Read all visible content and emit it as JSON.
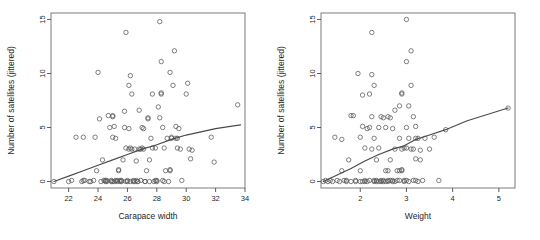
{
  "figure": {
    "type": "scatter-matrix",
    "panel_count": 2,
    "background": "#ffffff",
    "point_color": "#555555",
    "line_color": "#4a4a4a"
  },
  "panels": [
    {
      "id": "carapace-width",
      "xlabel": "Carapace width",
      "ylabel": "Number of satellites (jittered)",
      "xticks": [
        "22",
        "24",
        "26",
        "28",
        "30",
        "32",
        "34"
      ],
      "yticks": [
        "0",
        "5",
        "10",
        "15"
      ]
    },
    {
      "id": "weight",
      "xlabel": "Weight",
      "ylabel": "Number of satellites (jittered)",
      "xticks": [
        "2",
        "3",
        "4",
        "5"
      ],
      "yticks": [
        "0",
        "5",
        "10",
        "15"
      ]
    }
  ],
  "chart_data": [
    {
      "type": "scatter",
      "title": "",
      "xlabel": "Carapace width",
      "ylabel": "Number of satellites (jittered)",
      "xlim": [
        20.8,
        34.0
      ],
      "ylim": [
        -0.6,
        15.6
      ],
      "xticks": [
        22,
        24,
        26,
        28,
        30,
        32,
        34
      ],
      "yticks": [
        0,
        5,
        10,
        15
      ],
      "grid": false,
      "legend": "none",
      "marker": "open-circle",
      "points": [
        [
          21.0,
          0.0
        ],
        [
          22.0,
          0.0
        ],
        [
          22.5,
          4.1
        ],
        [
          22.9,
          0.0
        ],
        [
          23.1,
          0.1
        ],
        [
          23.0,
          4.1
        ],
        [
          23.8,
          4.1
        ],
        [
          23.7,
          0.1
        ],
        [
          23.9,
          1.0
        ],
        [
          24.0,
          10.1
        ],
        [
          24.1,
          5.8
        ],
        [
          24.2,
          0.0
        ],
        [
          24.3,
          2.0
        ],
        [
          24.5,
          0.0
        ],
        [
          24.5,
          0.1
        ],
        [
          24.6,
          0.0
        ],
        [
          24.7,
          6.1
        ],
        [
          24.8,
          5.0
        ],
        [
          24.9,
          0.0
        ],
        [
          24.9,
          0.1
        ],
        [
          25.0,
          6.0
        ],
        [
          25.0,
          6.1
        ],
        [
          25.0,
          4.1
        ],
        [
          25.1,
          5.1
        ],
        [
          25.1,
          0.0
        ],
        [
          25.2,
          0.1
        ],
        [
          25.2,
          4.0
        ],
        [
          25.3,
          0.0
        ],
        [
          25.4,
          1.1
        ],
        [
          25.4,
          1.0
        ],
        [
          25.5,
          0.0
        ],
        [
          25.6,
          0.1
        ],
        [
          25.7,
          2.0
        ],
        [
          25.8,
          5.0
        ],
        [
          25.8,
          6.5
        ],
        [
          25.9,
          13.8
        ],
        [
          25.9,
          0.0
        ],
        [
          25.9,
          3.1
        ],
        [
          26.0,
          0.0
        ],
        [
          26.0,
          0.1
        ],
        [
          26.1,
          8.9
        ],
        [
          26.1,
          4.9
        ],
        [
          26.1,
          3.0
        ],
        [
          26.2,
          9.8
        ],
        [
          26.2,
          3.1
        ],
        [
          26.2,
          0.0
        ],
        [
          26.3,
          8.1
        ],
        [
          26.3,
          3.0
        ],
        [
          26.4,
          0.1
        ],
        [
          26.5,
          0.0
        ],
        [
          26.5,
          3.0
        ],
        [
          26.6,
          1.9
        ],
        [
          26.7,
          0.0
        ],
        [
          26.8,
          6.6
        ],
        [
          26.9,
          0.1
        ],
        [
          27.0,
          5.0
        ],
        [
          27.1,
          4.9
        ],
        [
          27.1,
          3.0
        ],
        [
          27.2,
          0.0
        ],
        [
          27.3,
          1.0
        ],
        [
          27.4,
          5.9
        ],
        [
          27.4,
          5.8
        ],
        [
          27.5,
          2.0
        ],
        [
          27.5,
          0.0
        ],
        [
          27.6,
          4.0
        ],
        [
          27.7,
          8.1
        ],
        [
          27.7,
          3.1
        ],
        [
          27.8,
          0.0
        ],
        [
          27.9,
          3.1
        ],
        [
          28.0,
          0.1
        ],
        [
          28.1,
          6.9
        ],
        [
          28.2,
          14.8
        ],
        [
          28.2,
          5.9
        ],
        [
          28.3,
          8.1
        ],
        [
          28.3,
          8.2
        ],
        [
          28.3,
          11.1
        ],
        [
          28.4,
          5.0
        ],
        [
          28.5,
          0.0
        ],
        [
          28.5,
          3.1
        ],
        [
          28.6,
          1.0
        ],
        [
          28.7,
          4.0
        ],
        [
          28.8,
          0.0
        ],
        [
          28.9,
          1.0
        ],
        [
          28.9,
          1.1
        ],
        [
          28.9,
          10.1
        ],
        [
          29.0,
          4.0
        ],
        [
          29.0,
          4.1
        ],
        [
          29.1,
          8.9
        ],
        [
          29.2,
          12.1
        ],
        [
          29.3,
          5.1
        ],
        [
          29.3,
          4.0
        ],
        [
          29.4,
          3.1
        ],
        [
          29.5,
          4.9
        ],
        [
          29.6,
          3.0
        ],
        [
          29.7,
          0.1
        ],
        [
          30.0,
          8.1
        ],
        [
          30.1,
          9.1
        ],
        [
          30.2,
          3.0
        ],
        [
          30.3,
          2.1
        ],
        [
          30.4,
          2.9
        ],
        [
          31.7,
          4.1
        ],
        [
          31.9,
          1.8
        ],
        [
          33.5,
          7.1
        ],
        [
          23.0,
          0.1
        ],
        [
          23.4,
          0.0
        ],
        [
          24.4,
          0.1
        ],
        [
          25.6,
          0.0
        ],
        [
          26.6,
          0.1
        ],
        [
          27.2,
          0.0
        ],
        [
          27.9,
          0.1
        ],
        [
          25.3,
          0.1
        ],
        [
          26.7,
          0.0
        ],
        [
          28.0,
          0.0
        ],
        [
          28.4,
          0.1
        ],
        [
          26.9,
          3.0
        ],
        [
          27.0,
          3.1
        ],
        [
          26.8,
          3.0
        ],
        [
          25.0,
          0.0
        ],
        [
          25.5,
          0.1
        ],
        [
          26.4,
          0.0
        ],
        [
          24.6,
          0.1
        ],
        [
          23.5,
          0.0
        ],
        [
          22.2,
          0.1
        ],
        [
          29.4,
          4.0
        ]
      ],
      "trend_line": {
        "type": "smoothed",
        "points": [
          [
            21.0,
            0.0
          ],
          [
            22.0,
            0.5
          ],
          [
            23.0,
            1.0
          ],
          [
            24.0,
            1.5
          ],
          [
            25.0,
            2.0
          ],
          [
            26.0,
            2.5
          ],
          [
            27.0,
            3.0
          ],
          [
            28.0,
            3.4
          ],
          [
            29.0,
            3.9
          ],
          [
            30.0,
            4.3
          ],
          [
            31.0,
            4.6
          ],
          [
            32.0,
            4.9
          ],
          [
            33.0,
            5.1
          ],
          [
            33.7,
            5.25
          ]
        ]
      }
    },
    {
      "type": "scatter",
      "title": "",
      "xlabel": "Weight",
      "ylabel": "Number of satellites (jittered)",
      "xlim": [
        1.15,
        5.35
      ],
      "ylim": [
        -0.6,
        15.6
      ],
      "xticks": [
        2,
        3,
        4,
        5
      ],
      "yticks": [
        0,
        5,
        10,
        15
      ],
      "grid": false,
      "legend": "none",
      "marker": "open-circle",
      "points": [
        [
          1.2,
          0.0
        ],
        [
          1.25,
          0.1
        ],
        [
          1.3,
          0.0
        ],
        [
          1.35,
          0.1
        ],
        [
          1.4,
          0.0
        ],
        [
          1.45,
          4.1
        ],
        [
          1.5,
          0.1
        ],
        [
          1.55,
          0.0
        ],
        [
          1.6,
          1.0
        ],
        [
          1.6,
          3.9
        ],
        [
          1.65,
          0.1
        ],
        [
          1.7,
          0.0
        ],
        [
          1.75,
          2.0
        ],
        [
          1.8,
          6.1
        ],
        [
          1.85,
          6.1
        ],
        [
          1.9,
          0.1
        ],
        [
          1.95,
          10.0
        ],
        [
          2.0,
          0.0
        ],
        [
          2.0,
          4.1
        ],
        [
          2.0,
          1.0
        ],
        [
          2.05,
          5.1
        ],
        [
          2.05,
          8.0
        ],
        [
          2.1,
          0.1
        ],
        [
          2.1,
          3.1
        ],
        [
          2.15,
          4.9
        ],
        [
          2.15,
          0.0
        ],
        [
          2.2,
          8.1
        ],
        [
          2.2,
          5.0
        ],
        [
          2.25,
          9.9
        ],
        [
          2.25,
          13.8
        ],
        [
          2.25,
          6.0
        ],
        [
          2.25,
          3.0
        ],
        [
          2.3,
          0.1
        ],
        [
          2.3,
          8.9
        ],
        [
          2.3,
          4.0
        ],
        [
          2.35,
          2.0
        ],
        [
          2.35,
          0.0
        ],
        [
          2.4,
          5.0
        ],
        [
          2.4,
          3.1
        ],
        [
          2.45,
          6.0
        ],
        [
          2.45,
          0.1
        ],
        [
          2.5,
          5.9
        ],
        [
          2.5,
          0.0
        ],
        [
          2.55,
          1.0
        ],
        [
          2.55,
          5.0
        ],
        [
          2.6,
          6.0
        ],
        [
          2.6,
          0.1
        ],
        [
          2.65,
          2.0
        ],
        [
          2.65,
          5.9
        ],
        [
          2.7,
          0.0
        ],
        [
          2.7,
          4.9
        ],
        [
          2.75,
          6.6
        ],
        [
          2.75,
          3.0
        ],
        [
          2.8,
          1.0
        ],
        [
          2.8,
          0.1
        ],
        [
          2.85,
          7.0
        ],
        [
          2.85,
          4.0
        ],
        [
          2.9,
          8.1
        ],
        [
          2.9,
          8.2
        ],
        [
          2.9,
          1.1
        ],
        [
          2.95,
          3.1
        ],
        [
          2.95,
          0.0
        ],
        [
          3.0,
          15.0
        ],
        [
          3.0,
          11.1
        ],
        [
          3.0,
          5.0
        ],
        [
          3.0,
          0.1
        ],
        [
          3.05,
          7.0
        ],
        [
          3.05,
          4.0
        ],
        [
          3.1,
          12.1
        ],
        [
          3.1,
          8.9
        ],
        [
          3.15,
          6.0
        ],
        [
          3.15,
          3.0
        ],
        [
          3.2,
          5.1
        ],
        [
          3.2,
          4.0
        ],
        [
          3.2,
          2.1
        ],
        [
          3.25,
          4.0
        ],
        [
          3.25,
          0.0
        ],
        [
          3.3,
          2.0
        ],
        [
          3.3,
          2.9
        ],
        [
          3.35,
          0.1
        ],
        [
          3.4,
          4.0
        ],
        [
          3.5,
          3.0
        ],
        [
          3.6,
          4.1
        ],
        [
          3.7,
          0.1
        ],
        [
          3.85,
          4.8
        ],
        [
          5.2,
          6.8
        ],
        [
          1.9,
          0.0
        ],
        [
          2.1,
          0.0
        ],
        [
          2.2,
          0.1
        ],
        [
          2.35,
          0.1
        ],
        [
          2.45,
          0.0
        ],
        [
          2.55,
          0.0
        ],
        [
          2.65,
          0.1
        ],
        [
          2.75,
          0.0
        ],
        [
          2.85,
          0.1
        ],
        [
          2.95,
          0.1
        ],
        [
          3.05,
          0.0
        ],
        [
          3.15,
          0.1
        ],
        [
          2.3,
          0.0
        ],
        [
          2.4,
          0.0
        ],
        [
          2.5,
          0.1
        ],
        [
          2.6,
          0.0
        ],
        [
          2.7,
          0.1
        ],
        [
          1.7,
          0.1
        ],
        [
          1.8,
          0.0
        ],
        [
          2.05,
          0.0
        ],
        [
          3.2,
          0.1
        ],
        [
          3.0,
          3.1
        ],
        [
          2.9,
          3.0
        ],
        [
          3.1,
          3.0
        ],
        [
          2.6,
          1.0
        ],
        [
          2.85,
          1.0
        ],
        [
          2.9,
          1.0
        ]
      ],
      "trend_line": {
        "type": "smoothed",
        "points": [
          [
            1.2,
            0.0
          ],
          [
            1.5,
            0.6
          ],
          [
            1.8,
            1.2
          ],
          [
            2.1,
            1.9
          ],
          [
            2.4,
            2.5
          ],
          [
            2.7,
            3.0
          ],
          [
            2.95,
            3.3
          ],
          [
            3.2,
            3.9
          ],
          [
            3.5,
            4.3
          ],
          [
            3.85,
            4.8
          ],
          [
            4.3,
            5.6
          ],
          [
            4.75,
            6.2
          ],
          [
            5.2,
            6.8
          ]
        ]
      }
    }
  ]
}
